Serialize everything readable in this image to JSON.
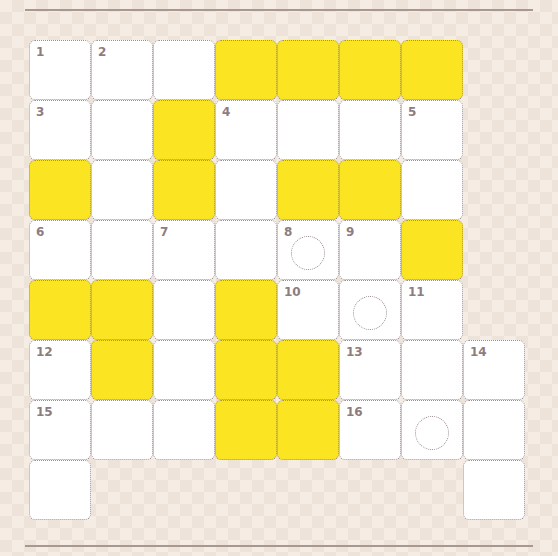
{
  "puzzle": {
    "type": "crossword",
    "rows": 8,
    "cols": 8,
    "colors": {
      "white": "#ffffff",
      "yellow": "#fbe522",
      "border": "#9c8c90",
      "number": "#8e7c80"
    },
    "grid": [
      [
        "W",
        "W",
        "W",
        "Y",
        "Y",
        "Y",
        "Y",
        "_"
      ],
      [
        "W",
        "W",
        "Y",
        "W",
        "W",
        "W",
        "W",
        "_"
      ],
      [
        "Y",
        "W",
        "Y",
        "W",
        "Y",
        "Y",
        "W",
        "_"
      ],
      [
        "W",
        "W",
        "W",
        "W",
        "W",
        "W",
        "Y",
        "_"
      ],
      [
        "Y",
        "Y",
        "W",
        "Y",
        "W",
        "W",
        "W",
        "_"
      ],
      [
        "W",
        "Y",
        "W",
        "Y",
        "Y",
        "W",
        "W",
        "W"
      ],
      [
        "W",
        "W",
        "W",
        "Y",
        "Y",
        "W",
        "W",
        "W"
      ],
      [
        "W",
        "_",
        "_",
        "_",
        "_",
        "_",
        "_",
        "W"
      ]
    ],
    "numbers": [
      {
        "row": 0,
        "col": 0,
        "label": "1"
      },
      {
        "row": 0,
        "col": 1,
        "label": "2"
      },
      {
        "row": 1,
        "col": 0,
        "label": "3"
      },
      {
        "row": 1,
        "col": 3,
        "label": "4"
      },
      {
        "row": 1,
        "col": 6,
        "label": "5"
      },
      {
        "row": 3,
        "col": 0,
        "label": "6"
      },
      {
        "row": 3,
        "col": 2,
        "label": "7"
      },
      {
        "row": 3,
        "col": 4,
        "label": "8"
      },
      {
        "row": 3,
        "col": 5,
        "label": "9"
      },
      {
        "row": 4,
        "col": 4,
        "label": "10"
      },
      {
        "row": 4,
        "col": 6,
        "label": "11"
      },
      {
        "row": 5,
        "col": 0,
        "label": "12"
      },
      {
        "row": 5,
        "col": 5,
        "label": "13"
      },
      {
        "row": 5,
        "col": 7,
        "label": "14"
      },
      {
        "row": 6,
        "col": 0,
        "label": "15"
      },
      {
        "row": 6,
        "col": 5,
        "label": "16"
      }
    ],
    "circled_cells": [
      {
        "row": 3,
        "col": 4
      },
      {
        "row": 4,
        "col": 5
      },
      {
        "row": 6,
        "col": 6
      }
    ]
  }
}
